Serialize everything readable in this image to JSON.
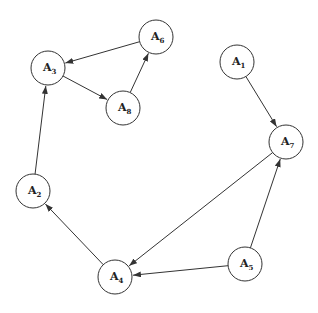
{
  "diagram": {
    "type": "directed-graph",
    "colors": {
      "stroke": "#333333",
      "fill": "#ffffff",
      "text": "#222222"
    },
    "node_radius": 17,
    "nodes": [
      {
        "id": "A1",
        "letter": "A",
        "sub": "1",
        "x": 237,
        "y": 62
      },
      {
        "id": "A2",
        "letter": "A",
        "sub": "2",
        "x": 33,
        "y": 191
      },
      {
        "id": "A3",
        "letter": "A",
        "sub": "3",
        "x": 48,
        "y": 68
      },
      {
        "id": "A4",
        "letter": "A",
        "sub": "4",
        "x": 115,
        "y": 277
      },
      {
        "id": "A5",
        "letter": "A",
        "sub": "5",
        "x": 245,
        "y": 264
      },
      {
        "id": "A6",
        "letter": "A",
        "sub": "6",
        "x": 156,
        "y": 37
      },
      {
        "id": "A7",
        "letter": "A",
        "sub": "7",
        "x": 286,
        "y": 142
      },
      {
        "id": "A8",
        "letter": "A",
        "sub": "8",
        "x": 123,
        "y": 108
      }
    ],
    "edges": [
      {
        "from": "A6",
        "to": "A3"
      },
      {
        "from": "A3",
        "to": "A8"
      },
      {
        "from": "A8",
        "to": "A6"
      },
      {
        "from": "A2",
        "to": "A3"
      },
      {
        "from": "A4",
        "to": "A2"
      },
      {
        "from": "A7",
        "to": "A4"
      },
      {
        "from": "A5",
        "to": "A4"
      },
      {
        "from": "A5",
        "to": "A7"
      },
      {
        "from": "A1",
        "to": "A7"
      }
    ]
  }
}
